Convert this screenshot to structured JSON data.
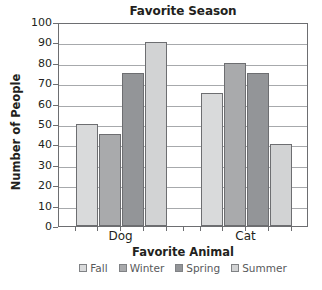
{
  "chart_data": {
    "type": "bar",
    "title": "Favorite Season",
    "xlabel": "Favorite Animal",
    "ylabel": "Number of People",
    "categories": [
      "Dog",
      "Cat"
    ],
    "series": [
      {
        "name": "Fall",
        "values": [
          50,
          65
        ],
        "color": "#d9dadb"
      },
      {
        "name": "Winter",
        "values": [
          45,
          80
        ],
        "color": "#a9aaac"
      },
      {
        "name": "Spring",
        "values": [
          75,
          75
        ],
        "color": "#939598"
      },
      {
        "name": "Summer",
        "values": [
          90,
          40
        ],
        "color": "#d2d3d4"
      }
    ],
    "ylim": [
      0,
      100
    ],
    "ytick_step": 10,
    "yticks": [
      0,
      10,
      20,
      30,
      40,
      50,
      60,
      70,
      80,
      90,
      100
    ],
    "ytick_labels": [
      "0",
      "10",
      "20",
      "30",
      "40",
      "50",
      "60",
      "70",
      "80",
      "90",
      "100"
    ],
    "grid": true,
    "grid_axis": "y",
    "legend_position": "bottom",
    "legend_entries": [
      "Fall",
      "Winter",
      "Spring",
      "Summer"
    ],
    "axis_color": "#6d6e71",
    "grid_color": "#a7a9ac",
    "text_color": "#231f20",
    "background": "#ffffff"
  }
}
